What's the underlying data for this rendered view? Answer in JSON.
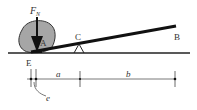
{
  "diagram": {
    "labels": {
      "force": "F",
      "force_sub": "N",
      "point_a": "A",
      "point_b": "B",
      "point_c": "C",
      "point_e": "E",
      "dim_a": "a",
      "dim_b": "b",
      "dim_e": "e"
    },
    "colors": {
      "rock_fill": "#a6a6a6",
      "rock_stroke": "#333333",
      "line": "#111111",
      "dim_line": "#555555"
    }
  }
}
